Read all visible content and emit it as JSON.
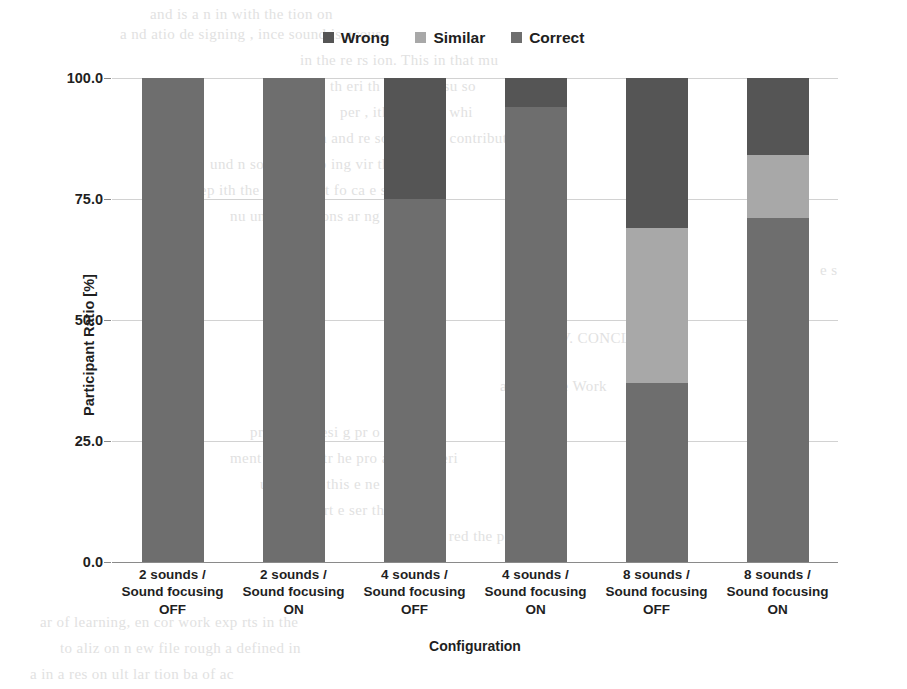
{
  "chart_data": {
    "type": "bar",
    "title": "",
    "subtitle": "",
    "xlabel": "Configuration",
    "ylabel": "Participant Ratio [%]",
    "ylim": [
      0,
      100
    ],
    "yticks": [
      "0.0",
      "25.0",
      "50.0",
      "75.0",
      "100.0"
    ],
    "ytick_values": [
      0,
      25,
      50,
      75,
      100
    ],
    "grid": true,
    "stacked": true,
    "stack_order_bottom_to_top": [
      "Correct",
      "Similar",
      "Wrong"
    ],
    "legend_position": "top-center",
    "categories": [
      "2 sounds /\nSound focusing\nOFF",
      "2 sounds /\nSound focusing\nON",
      "4 sounds /\nSound focusing\nOFF",
      "4 sounds /\nSound focusing\nON",
      "8 sounds /\nSound focusing\nOFF",
      "8 sounds /\nSound focusing\nON"
    ],
    "series": [
      {
        "name": "Wrong",
        "color": "#555555",
        "values": [
          0,
          0,
          25,
          6,
          31,
          16
        ]
      },
      {
        "name": "Similar",
        "color": "#a8a8a8",
        "values": [
          0,
          0,
          0,
          0,
          32,
          13
        ]
      },
      {
        "name": "Correct",
        "color": "#6e6e6e",
        "values": [
          100,
          100,
          75,
          94,
          37,
          71
        ]
      }
    ]
  },
  "legend": {
    "items": [
      {
        "label": "Wrong",
        "color": "#555555"
      },
      {
        "label": "Similar",
        "color": "#a8a8a8"
      },
      {
        "label": "Correct",
        "color": "#6e6e6e"
      }
    ]
  },
  "axes": {
    "x_title": "Configuration",
    "y_title": "Participant Ratio [%]",
    "y_ticks": [
      "100.0",
      "75.0",
      "50.0",
      "25.0",
      "0.0"
    ],
    "x_ticks": [
      "2 sounds /\nSound focusing\nOFF",
      "2 sounds /\nSound focusing\nON",
      "4 sounds /\nSound focusing\nOFF",
      "4 sounds /\nSound focusing\nON",
      "8 sounds /\nSound focusing\nOFF",
      "8 sounds /\nSound focusing\nON"
    ]
  },
  "background_text": {
    "lines": [
      {
        "text": "and  is  a  n       in     with    the     tion   on",
        "x": 150,
        "y": 6
      },
      {
        "text": "a    nd   atio   de  signing   ,   ince  sound   is  acous",
        "x": 120,
        "y": 26
      },
      {
        "text": "in  the   re   rs   ion.   This   in   that   mu",
        "x": 300,
        "y": 52
      },
      {
        "text": "th    eri   th   ,  and  the   su   so",
        "x": 330,
        "y": 78
      },
      {
        "text": "per   ,    ith   this   e    th    whi",
        "x": 340,
        "y": 104
      },
      {
        "text": "com   and    re   sounds,    a   e  contribution",
        "x": 300,
        "y": 130
      },
      {
        "text": "und   n   so   tha   en   up   ing   vir   the   soun",
        "x": 210,
        "y": 156
      },
      {
        "text": "e v    e   rep    ith   the   p    diffe   ent   fo   ca   e  s  ou",
        "x": 160,
        "y": 182
      },
      {
        "text": "nu    und    in   d   s   ions    ar   ng   the   user",
        "x": 230,
        "y": 208
      },
      {
        "text": "a  it   dis",
        "x": 760,
        "y": 234
      },
      {
        "text": "e   s",
        "x": 820,
        "y": 262
      },
      {
        "text": "V.   CONCLUSION",
        "x": 560,
        "y": 330
      },
      {
        "text": "and  Future  Work",
        "x": 500,
        "y": 378
      },
      {
        "text": "pro   a   sou    desi   g     pr   o    y  for  a",
        "x": 250,
        "y": 424
      },
      {
        "text": "ment   on   dem   str    he   pro   al   in   a  xperi",
        "x": 230,
        "y": 450
      },
      {
        "text": "ude   at   the   this    e   ne   soun    and",
        "x": 260,
        "y": 476
      },
      {
        "text": "the    rt   e   ser   th   th   ion",
        "x": 300,
        "y": 502
      },
      {
        "text": "re   u   red  the   p",
        "x": 420,
        "y": 528
      },
      {
        "text": "ar   of   learning,    en   cor    work   exp   rts   in  the",
        "x": 40,
        "y": 614
      },
      {
        "text": "to   aliz   on   n   ew   file    rough   a   defined   in",
        "x": 60,
        "y": 640
      },
      {
        "text": "a   in   a   res   on   ult   lar   tion   ba    of   ac",
        "x": 30,
        "y": 666
      }
    ]
  }
}
